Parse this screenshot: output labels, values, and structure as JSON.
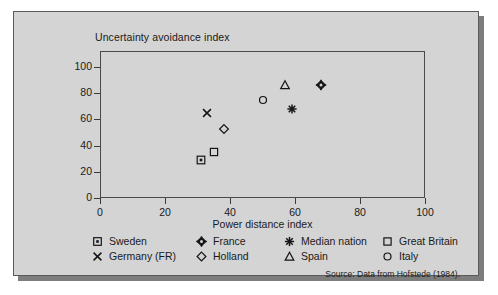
{
  "figure": {
    "background_color": "#d4d4d4",
    "border_color": "#5a5a5a",
    "source_note": "Source: Data from Hofstede (1984)."
  },
  "axes": {
    "y_title": "Uncertainty avoidance index",
    "x_title": "Power distance index",
    "y_ticks": [
      "0",
      "20",
      "40",
      "60",
      "80",
      "100"
    ],
    "x_ticks": [
      "0",
      "20",
      "40",
      "60",
      "80",
      "100"
    ]
  },
  "legend": {
    "entries": [
      {
        "label": "Sweden",
        "glyph": "square-dot-icon",
        "row": 0,
        "col": 0
      },
      {
        "label": "France",
        "glyph": "diamond-cross-icon",
        "row": 0,
        "col": 1
      },
      {
        "label": "Median nation",
        "glyph": "asterisk-icon",
        "row": 0,
        "col": 2
      },
      {
        "label": "Great Britain",
        "glyph": "square-icon",
        "row": 0,
        "col": 3
      },
      {
        "label": "Germany (FR)",
        "glyph": "cross-x-icon",
        "row": 1,
        "col": 0
      },
      {
        "label": "Holland",
        "glyph": "diamond-icon",
        "row": 1,
        "col": 1
      },
      {
        "label": "Spain",
        "glyph": "triangle-icon",
        "row": 1,
        "col": 2
      },
      {
        "label": "Italy",
        "glyph": "circle-icon",
        "row": 1,
        "col": 3
      }
    ]
  },
  "chart_data": {
    "type": "scatter",
    "title": "",
    "xlabel": "Power distance index",
    "ylabel": "Uncertainty avoidance index",
    "xlim": [
      0,
      100
    ],
    "ylim": [
      0,
      100
    ],
    "xticks": [
      0,
      20,
      40,
      60,
      80,
      100
    ],
    "yticks": [
      0,
      20,
      40,
      60,
      80,
      100
    ],
    "grid": false,
    "legend_position": "below-axes",
    "source": "Source: Data from Hofstede (1984).",
    "points": [
      {
        "name": "Sweden",
        "x": 31,
        "y": 29,
        "marker": "square-dot-icon"
      },
      {
        "name": "Great Britain",
        "x": 35,
        "y": 35,
        "marker": "square-icon"
      },
      {
        "name": "Germany (FR)",
        "x": 33,
        "y": 65,
        "marker": "cross-x-icon"
      },
      {
        "name": "Holland",
        "x": 38,
        "y": 53,
        "marker": "diamond-icon"
      },
      {
        "name": "Italy",
        "x": 50,
        "y": 75,
        "marker": "circle-icon"
      },
      {
        "name": "Spain",
        "x": 57,
        "y": 86,
        "marker": "triangle-icon"
      },
      {
        "name": "Median nation",
        "x": 59,
        "y": 68,
        "marker": "asterisk-icon"
      },
      {
        "name": "France",
        "x": 68,
        "y": 86,
        "marker": "diamond-cross-icon"
      }
    ]
  }
}
